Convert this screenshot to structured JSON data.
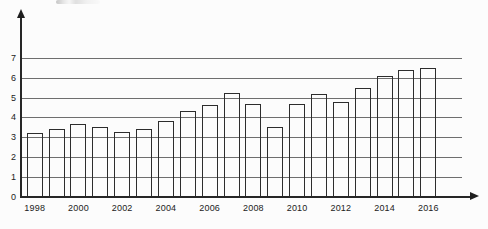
{
  "colors": {
    "background": "#fcfcfc",
    "bar_outline": "#2d2d2d",
    "axis": "#262626",
    "gridline": "#6e6e6e",
    "tick_text": "#222222"
  },
  "chart_data": {
    "type": "bar",
    "title": "",
    "xlabel": "",
    "ylabel": "",
    "categories": [
      1998,
      1999,
      2000,
      2001,
      2002,
      2003,
      2004,
      2005,
      2006,
      2007,
      2008,
      2009,
      2010,
      2011,
      2012,
      2013,
      2014,
      2015,
      2016
    ],
    "values": [
      3.2,
      3.4,
      3.65,
      3.5,
      3.25,
      3.4,
      3.8,
      4.3,
      4.65,
      5.25,
      4.7,
      3.5,
      4.7,
      5.2,
      4.8,
      5.5,
      6.1,
      6.4,
      6.5
    ],
    "ylim": [
      0,
      7.8
    ],
    "yticks": [
      0,
      1,
      2,
      3,
      4,
      5,
      6,
      7
    ],
    "x_tick_labels": [
      "1998",
      "2000",
      "2002",
      "2004",
      "2006",
      "2008",
      "2010",
      "2012",
      "2014",
      "2016"
    ],
    "grid": "horizontal",
    "gridlines_at": [
      1,
      2,
      3,
      4,
      5,
      6,
      7
    ],
    "bars_filled": false,
    "legend": "none",
    "axis_arrows": [
      "up",
      "right"
    ]
  }
}
